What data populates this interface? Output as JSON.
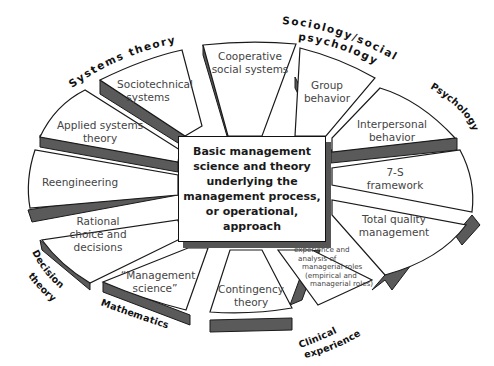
{
  "diagram": {
    "type": "radial-wedge-diagram",
    "center": {
      "label": "Basic management\nscience and theory\nunderlying the\nmanagement process,\nor operational,\napproach"
    },
    "wedges": [
      {
        "id": "sociotechnical",
        "label_lines": [
          "Sociotechnical",
          "systems"
        ]
      },
      {
        "id": "cooperative",
        "label_lines": [
          "Cooperative",
          "social systems"
        ]
      },
      {
        "id": "group-behavior",
        "label_lines": [
          "Group",
          "behavior"
        ]
      },
      {
        "id": "interpersonal",
        "label_lines": [
          "Interpersonal",
          "behavior"
        ]
      },
      {
        "id": "seven-s",
        "label_lines": [
          "7-S",
          "framework"
        ]
      },
      {
        "id": "tqm",
        "label_lines": [
          "Total quality",
          "management"
        ]
      },
      {
        "id": "distilled",
        "label_lines": [
          "Distilled",
          "managing",
          "experience and",
          "analysis of",
          "managerial roles",
          "(empirical and",
          "managerial roles)"
        ]
      },
      {
        "id": "contingency",
        "label_lines": [
          "Contingency",
          "theory"
        ]
      },
      {
        "id": "management-science",
        "label_lines": [
          "“Management",
          "science”"
        ]
      },
      {
        "id": "rational-choice",
        "label_lines": [
          "Rational",
          "choice and",
          "decisions"
        ]
      },
      {
        "id": "reengineering",
        "label_lines": [
          "Reengineering"
        ]
      },
      {
        "id": "applied-systems",
        "label_lines": [
          "Applied systems",
          "theory"
        ]
      }
    ],
    "outer_labels": {
      "systems_theory": "Systems theory",
      "sociology": "Sociology/social",
      "sociology2": "psychology",
      "psychology": "Psychology",
      "decision_theory_1": "Decision",
      "decision_theory_2": "theory",
      "mathematics": "Mathematics",
      "clinical_1": "Clinical",
      "clinical_2": "experience"
    },
    "colors": {
      "wedge_fill": "#ffffff",
      "wedge_side": "#5a5a5a",
      "outline": "#1a1a1a",
      "text": "#444444"
    }
  }
}
